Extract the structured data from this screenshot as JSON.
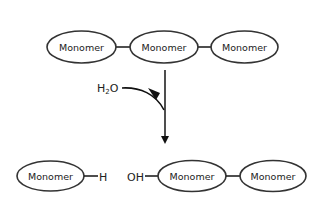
{
  "diagram": {
    "top_chain": {
      "monomers": [
        {
          "label": "Monomer"
        },
        {
          "label": "Monomer"
        },
        {
          "label": "Monomer"
        }
      ]
    },
    "reagent": {
      "label_main": "H",
      "label_sub": "2",
      "label_tail": "O"
    },
    "products": {
      "left_fragment": {
        "monomers": [
          {
            "label": "Monomer"
          }
        ],
        "end_group": "H"
      },
      "right_fragment": {
        "start_group": "OH",
        "monomers": [
          {
            "label": "Monomer"
          },
          {
            "label": "Monomer"
          }
        ]
      }
    },
    "colors": {
      "stroke": "#333333",
      "background": "#ffffff",
      "text": "#222222"
    }
  }
}
